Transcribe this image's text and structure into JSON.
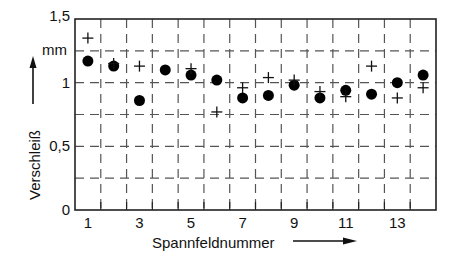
{
  "chart_data": {
    "type": "scatter",
    "title": "",
    "xlabel": "Spannfeldnummer",
    "ylabel": "Verschleiß",
    "yunit": "mm",
    "xlim": [
      0.5,
      14.5
    ],
    "ylim": [
      0,
      1.5
    ],
    "xticks": [
      1,
      3,
      5,
      7,
      9,
      11,
      13
    ],
    "xtick_labels": [
      "1",
      "3",
      "5",
      "7",
      "9",
      "11",
      "13"
    ],
    "yticks": [
      0,
      0.5,
      1,
      1.5
    ],
    "ytick_labels": [
      "0",
      "0,5",
      "1",
      "1,5"
    ],
    "grid": true,
    "grid_style": "dashed",
    "grid_x": [
      1.5,
      2.5,
      3.5,
      4.5,
      5.5,
      6.5,
      7.5,
      8.5,
      9.5,
      10.5,
      11.5,
      12.5,
      13.5
    ],
    "grid_y": [
      0.25,
      0.5,
      0.75,
      1.0,
      1.25
    ],
    "legend": null,
    "series": [
      {
        "name": "dot",
        "marker": "circle",
        "x": [
          1,
          2,
          3,
          4,
          5,
          6,
          7,
          8,
          9,
          10,
          11,
          12,
          13,
          14
        ],
        "values": [
          1.17,
          1.13,
          0.86,
          1.1,
          1.06,
          1.02,
          0.88,
          0.9,
          0.98,
          0.88,
          0.94,
          0.91,
          1.0,
          1.06
        ]
      },
      {
        "name": "plus",
        "marker": "plus",
        "x": [
          1,
          2,
          3,
          5,
          6,
          7,
          8,
          9,
          10,
          11,
          12,
          13,
          14
        ],
        "values": [
          1.35,
          1.15,
          1.13,
          1.11,
          0.77,
          0.96,
          1.04,
          1.02,
          0.93,
          0.89,
          1.13,
          0.88,
          0.96
        ]
      }
    ]
  },
  "labels": {
    "yunit": "mm",
    "ylabel": "Verschleiß",
    "xlabel": "Spannfeldnummer"
  }
}
